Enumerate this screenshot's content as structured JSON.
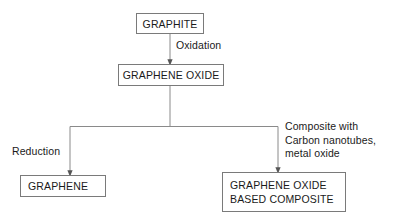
{
  "diagram": {
    "background_color": "#ffffff",
    "line_color": "#7a7a7a",
    "text_color": "#1a1a1a",
    "nodes": [
      {
        "id": "graphite",
        "label": "GRAPHITE",
        "shape": "rectangle",
        "align": "center"
      },
      {
        "id": "graphene_oxide",
        "label": "GRAPHENE OXIDE",
        "shape": "rectangle",
        "align": "center"
      },
      {
        "id": "graphene",
        "label": "GRAPHENE",
        "shape": "rectangle",
        "align": "left"
      },
      {
        "id": "go_composite",
        "line1": "GRAPHENE OXIDE",
        "line2": "BASED COMPOSITE",
        "shape": "rectangle",
        "align": "left"
      }
    ],
    "edge_labels": {
      "oxidation": "Oxidation",
      "reduction": "Reduction",
      "composite_line1": "Composite with",
      "composite_line2": "Carbon nanotubes,",
      "composite_line3": "metal oxide"
    }
  }
}
